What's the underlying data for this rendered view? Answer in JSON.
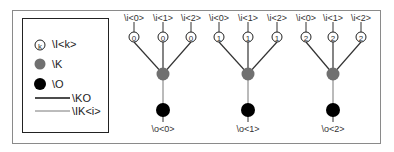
{
  "legend": {
    "items": [
      {
        "symbol": "circled-k-icon",
        "glyph": "k",
        "label": "\\I<k>"
      },
      {
        "symbol": "grey-node-icon",
        "color": "#707070",
        "label": "\\K"
      },
      {
        "symbol": "black-node-icon",
        "color": "#000000",
        "label": "\\O"
      },
      {
        "symbol": "thick-line-icon",
        "label": "\\KO"
      },
      {
        "symbol": "thin-line-icon",
        "label": "\\IK<i>"
      }
    ]
  },
  "trees": [
    {
      "leaf_labels": [
        "\\i<0>",
        "\\i<1>",
        "\\i<2>"
      ],
      "leaf_values": [
        "0",
        "0",
        "0"
      ],
      "output_label": "\\o<0>"
    },
    {
      "leaf_labels": [
        "\\i<0>",
        "\\i<1>",
        "\\i<2>"
      ],
      "leaf_values": [
        "1",
        "1",
        "1"
      ],
      "output_label": "\\o<1>"
    },
    {
      "leaf_labels": [
        "\\i<0>",
        "\\i<1>",
        "\\i<2>"
      ],
      "leaf_values": [
        "2",
        "2",
        "2"
      ],
      "output_label": "\\o<2>"
    }
  ],
  "colors": {
    "grey_node": "#707070",
    "black_node": "#000000",
    "frame": "#8a8a8a"
  }
}
